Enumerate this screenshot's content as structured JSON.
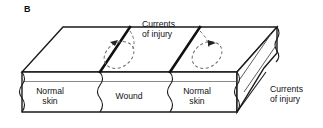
{
  "figure": {
    "panel_label": "B",
    "caption_concept": "currents-of-injury-skin-wound-block-diagram"
  },
  "block_labels": {
    "normal_skin_left_line1": "Normal",
    "normal_skin_left_line2": "skin",
    "wound": "Wound",
    "normal_skin_right_line1": "Normal",
    "normal_skin_right_line2": "skin"
  },
  "annotations": {
    "currents_top_line1": "Currents",
    "currents_top_line2": "of injury",
    "currents_right_line1": "Currents",
    "currents_right_line2": "of injury"
  },
  "colors": {
    "background": "#ffffff",
    "outline": "#1a1a1a",
    "thick_divider": "#111111",
    "dashed_current": "#6e6e6e",
    "thin_rule": "#8a8a8a",
    "text": "#111111"
  },
  "geometry": {
    "top_face": "parallelogram",
    "front_face": "rectangle-with-wavy-segment-edges",
    "right_face": "end-cut-parallelogram",
    "segment_count": 3,
    "current_loop_count": 2,
    "loop_arrow_directions": [
      "left",
      "right"
    ]
  }
}
